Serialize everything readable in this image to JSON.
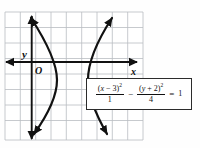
{
  "figure": {
    "kind": "coordinate-grid-graph",
    "background_color": "#fefefe",
    "grid": {
      "line_color": "#b9bcc2",
      "border_color": "#b9bcc2",
      "left": 5,
      "top": 12,
      "right": 143,
      "bottom": 140,
      "cell_width": 15.33,
      "cell_height": 15.5,
      "columns": 9,
      "rows": 8,
      "visible": true
    },
    "axes": {
      "color": "#111111",
      "x_axis": {
        "label": "x",
        "y_pixel": 62,
        "x_start": 5,
        "x_end": 137,
        "arrow_start": true,
        "arrow_end": true
      },
      "y_axis": {
        "label": "y",
        "x_pixel": 31.7,
        "y_start": 140,
        "y_end": 16,
        "arrow_start": true,
        "arrow_end": true
      },
      "origin_label": "O"
    },
    "curve": {
      "color": "#111111",
      "stroke_width": 2.2,
      "branches": 2,
      "left_branch_vertex_px": [
        57,
        80
      ],
      "right_branch_vertex_px": [
        88,
        80
      ],
      "arrowheads": 4
    }
  },
  "equation": {
    "full_text": "(x - 3)^2 / 1 - (y + 2)^2 / 4 = 1",
    "left_numerator_open": "(",
    "left_numerator_var": "x",
    "left_numerator_op": " − 3",
    "left_numerator_close": ")",
    "left_exponent": "2",
    "left_denominator": "1",
    "middle_operator": "−",
    "right_numerator_open": "(",
    "right_numerator_var": "y",
    "right_numerator_op": " + 2",
    "right_numerator_close": ")",
    "right_exponent": "2",
    "right_denominator": "4",
    "equals": "=",
    "result": "1",
    "box_border_color": "#2b2b2b",
    "box_fill": "#ffffff"
  }
}
